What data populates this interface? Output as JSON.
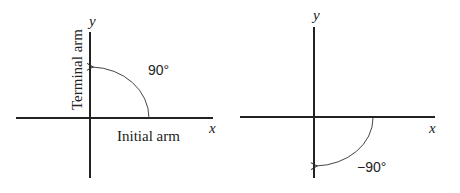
{
  "diagrams": [
    {
      "id": "positive-angle",
      "x_axis_label": "x",
      "y_axis_label": "y",
      "angle_label": "90°",
      "initial_arm_label": "Initial arm",
      "terminal_arm_label": "Terminal arm",
      "direction": "counterclockwise"
    },
    {
      "id": "negative-angle",
      "x_axis_label": "x",
      "y_axis_label": "y",
      "angle_label": "−90°",
      "direction": "clockwise"
    }
  ],
  "colors": {
    "axis": "#222222",
    "arc": "#444444",
    "background": "#ffffff"
  }
}
